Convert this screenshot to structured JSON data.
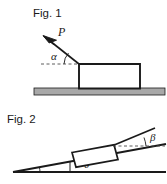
{
  "page": {
    "background_color": "#ffffff",
    "ink_color": "#1a1a1a",
    "ground_fill_color": "#a8a8a8",
    "dash_color": "#4a4a4a",
    "width": 167,
    "height": 184
  },
  "figures": [
    {
      "id": "fig1",
      "caption": "Fig. 1",
      "description": "Block resting on horizontal ground with an applied force P directed down toward the block at angle alpha above the horizontal.",
      "labels": {
        "force": "P",
        "angle": "α"
      },
      "elements": {
        "ground": "horizontal-hatched-ground-bar",
        "block": "rectangular-block",
        "force_arrow": "arrow-pointing-down-left-toward-block-corner",
        "reference_line": "horizontal-dashed-reference-line",
        "angle_arc": "arc-between-dashed-line-and-force-line"
      }
    },
    {
      "id": "fig2",
      "caption": "Fig. 2",
      "description": "Block on an inclined plane of angle theta, with a line from the block's upper corner rising at angle beta above the horizontal dashed reference.",
      "labels": {
        "incline_angle": "θ",
        "upper_angle": "β"
      },
      "elements": {
        "incline": "wedge-incline-triangle",
        "base": "horizontal-base-line",
        "block": "tilted-rectangular-block",
        "reference_line": "horizontal-dashed-reference-line",
        "theta_arc": "arc-between-base-and-incline-surface",
        "beta_arc": "arc-between-dashed-line-and-rising-line",
        "vertical_marker": "short-vertical-line-from-incline-to-base"
      }
    }
  ]
}
